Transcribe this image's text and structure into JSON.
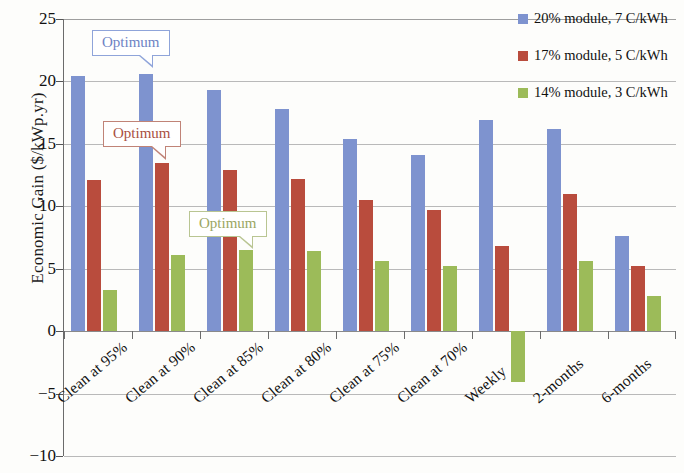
{
  "chart_data": {
    "type": "bar",
    "title": "",
    "xlabel": "",
    "ylabel": "Economic Gain ($/kWp.yr)",
    "ylim": [
      -10,
      25
    ],
    "yticks": [
      25,
      20,
      15,
      10,
      5,
      0,
      -5,
      -10
    ],
    "ytick_labels": [
      "25",
      "20",
      "15",
      "10",
      "5",
      "0",
      "−5",
      "−10"
    ],
    "grid": true,
    "legend_position": "top-right",
    "categories": [
      "Clean at 95%",
      "Clean at 90%",
      "Clean at 85%",
      "Clean at 80%",
      "Clean at 75%",
      "Clean at 70%",
      "Weekly",
      "2-months",
      "6-months"
    ],
    "series": [
      {
        "name": "20% module, 7 C/kWh",
        "color": "#7e93cf",
        "values": [
          20.4,
          20.6,
          19.3,
          17.8,
          15.4,
          14.1,
          16.9,
          16.2,
          7.6
        ]
      },
      {
        "name": "17% module, 5 C/kWh",
        "color": "#b94c3d",
        "values": [
          12.1,
          13.5,
          12.9,
          12.2,
          10.5,
          9.7,
          6.8,
          11.0,
          5.2
        ]
      },
      {
        "name": "14% module, 3 C/kWh",
        "color": "#9cbb59",
        "values": [
          3.3,
          6.1,
          6.5,
          6.4,
          5.6,
          5.2,
          -4.1,
          5.6,
          2.8
        ]
      }
    ],
    "annotations": [
      {
        "text": "Optimum",
        "series": "20% module, 7 C/kWh",
        "points_to_category": "Clean at 90%",
        "color": "#6d83c4"
      },
      {
        "text": "Optimum",
        "series": "17% module, 5 C/kWh",
        "points_to_category": "Clean at 90%",
        "color": "#a9503f"
      },
      {
        "text": "Optimum",
        "series": "14% module, 3 C/kWh",
        "points_to_category": "Clean at 85%",
        "color": "#9aa663"
      }
    ]
  },
  "legend": {
    "items": [
      {
        "label": "20% module, 7 C/kWh"
      },
      {
        "label": "17% module, 5 C/kWh"
      },
      {
        "label": "14% module, 3 C/kWh"
      }
    ]
  },
  "axis": {
    "y_title": "Economic Gain ($/kWp.yr)"
  }
}
